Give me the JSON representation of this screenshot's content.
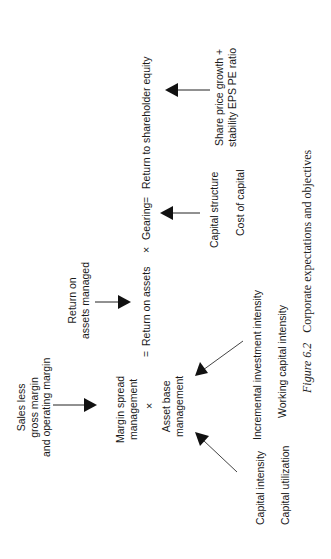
{
  "diagram": {
    "equation": {
      "eq1": "=",
      "return_on_assets": "Return on assets",
      "times1": "×",
      "gearing": "Gearing",
      "eq2": "=",
      "return_to_equity": "Return to shareholder equity"
    },
    "margin_spread": [
      "Margin spread",
      "management"
    ],
    "times2": "×",
    "asset_base": [
      "Asset base",
      "management"
    ],
    "sales_less": [
      "Sales less",
      "gross margin",
      "and operating margin"
    ],
    "return_on_assets_managed": [
      "Return on",
      "assets managed"
    ],
    "share_price": [
      "Share price growth +",
      "stability EPS PE ratio"
    ],
    "capital_structure": "Capital structure",
    "cost_of_capital": "Cost of capital",
    "incremental_investment": "Incremental investment intensity",
    "working_capital": "Working capital intensity",
    "capital_intensity": "Capital intensity",
    "capital_utilization": "Capital utilization",
    "caption": {
      "figure": "Figure 6.2",
      "title": "Corporate expectations and objectives"
    }
  },
  "colors": {
    "ink": "#1a1a1a",
    "arrow_thin": "#555555"
  }
}
